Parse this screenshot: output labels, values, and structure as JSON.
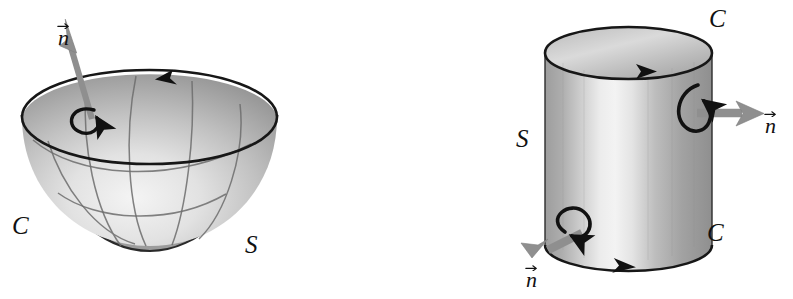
{
  "figure": {
    "background_color": "#ffffff",
    "width": 793,
    "height": 299,
    "ink_color": "#111111",
    "vector_color": "#8c8c8c",
    "surface_light": "#f0f0f0",
    "surface_mid": "#b8b8b8",
    "surface_dark": "#8e8e8e"
  },
  "panels": [
    {
      "id": "bowl",
      "name": "paraboloid-bowl",
      "shape": "bowl",
      "description": "Downward-opening bowl (paraboloid cap) with grid curves, upward unit normal at the interior, and counterclockwise-oriented rim curve.",
      "labels": {
        "normal": "n",
        "curve": "C",
        "surface": "S"
      },
      "boundary_arrow_direction": "leftward along back rim",
      "circulation_direction": "counterclockwise viewed from above",
      "normal_direction": "up and slightly right"
    },
    {
      "id": "cylinder",
      "name": "cylinder-lateral-surface",
      "shape": "cylinder",
      "description": "Vertical circular cylinder (lateral surface) with outward unit normals and two oppositely oriented boundary circles.",
      "labels": {
        "normal_top": "n",
        "normal_bottom": "n",
        "curve_top": "C",
        "curve_bottom": "C",
        "surface": "S"
      },
      "top_boundary_arrow_direction": "rightward along back of top rim",
      "bottom_boundary_arrow_direction": "rightward along front of bottom rim",
      "normal_top_direction": "outward to the right",
      "normal_bottom_direction": "outward to the lower left"
    }
  ],
  "labels": [
    {
      "key": "bowl_normal",
      "text": "n",
      "kind": "vector",
      "x": 58,
      "y": 20
    },
    {
      "key": "bowl_curve",
      "text": "C",
      "kind": "capital",
      "x": 12,
      "y": 213
    },
    {
      "key": "bowl_surface",
      "text": "S",
      "kind": "capital",
      "x": 245,
      "y": 232
    },
    {
      "key": "cyl_curve_top",
      "text": "C",
      "kind": "capital",
      "x": 709,
      "y": 6
    },
    {
      "key": "cyl_normal_top",
      "text": "n",
      "kind": "vector",
      "x": 765,
      "y": 108
    },
    {
      "key": "cyl_surface",
      "text": "S",
      "kind": "capital",
      "x": 516,
      "y": 126
    },
    {
      "key": "cyl_curve_bottom",
      "text": "C",
      "kind": "capital",
      "x": 707,
      "y": 220
    },
    {
      "key": "cyl_normal_bottom",
      "text": "n",
      "kind": "vector",
      "x": 526,
      "y": 262
    }
  ]
}
